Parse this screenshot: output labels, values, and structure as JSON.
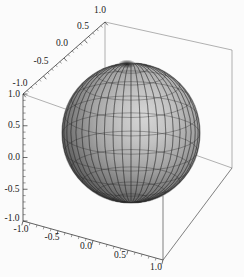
{
  "figure": {
    "type": "3d-surface-plot",
    "title": "",
    "background_color": "#fbfbfb",
    "frame_color": "#4a4a4a",
    "surface_name": "unit-sphere"
  },
  "chart_data": {
    "type": "scatter",
    "plot_style": "3d-parametric-surface",
    "title": "",
    "subtitle": "",
    "xlabel": "",
    "ylabel": "",
    "zlabel": "",
    "grid": false,
    "legend": "none",
    "surface": {
      "name": "Unit sphere",
      "equation": "x^2 + y^2 + z^2 = 1",
      "radius": 1.0,
      "center": [
        0,
        0,
        0
      ],
      "mesh_meridians": 24,
      "mesh_parallels": 12,
      "shading": "gray-diffuse",
      "light_direction": "upper-right",
      "color_min": "#2b2b2b",
      "color_max": "#d8d8d8"
    },
    "axes": [
      {
        "name": "depth-axis",
        "position": "top-left",
        "range": [
          -1.0,
          1.0
        ],
        "ticks": [
          -1.0,
          -0.5,
          0.0,
          0.5,
          1.0
        ],
        "tick_labels": [
          "-1.0",
          "-0.5",
          "0.0",
          "0.5",
          "1.0"
        ],
        "minor_ticks_per_interval": 4
      },
      {
        "name": "vertical-axis",
        "position": "left",
        "range": [
          -1.0,
          1.0
        ],
        "ticks": [
          -1.0,
          -0.5,
          0.0,
          0.5,
          1.0
        ],
        "tick_labels": [
          "-1.0",
          "-0.5",
          "0.0",
          "0.5",
          "1.0"
        ],
        "minor_ticks_per_interval": 4
      },
      {
        "name": "horizontal-axis",
        "position": "bottom",
        "range": [
          -1.0,
          1.0
        ],
        "ticks": [
          -1.0,
          -0.5,
          0.0,
          0.5,
          1.0
        ],
        "tick_labels": [
          "-1.0",
          "-0.5",
          "0.0",
          "0.5",
          "1.0"
        ],
        "minor_ticks_per_interval": 4
      }
    ],
    "x": [
      -1.0,
      -0.5,
      0.0,
      0.5,
      1.0
    ],
    "values": [
      -1.0,
      -0.5,
      0.0,
      0.5,
      1.0
    ],
    "categories": [
      "-1.0",
      "-0.5",
      "0.0",
      "0.5",
      "1.0"
    ],
    "xlim": [
      -1.0,
      1.0
    ],
    "ylim": [
      -1.0,
      1.0
    ],
    "zlim": [
      -1.0,
      1.0
    ]
  },
  "labels": {
    "depth_axis": {
      "t_neg1": "-1.0",
      "t_neg05": "-0.5",
      "t_0": "0.0",
      "t_05": "0.5",
      "t_1": "1.0"
    },
    "vertical_axis": {
      "t_1": "1.0",
      "t_05": "0.5",
      "t_0": "0.0",
      "t_neg05": "-0.5",
      "t_neg1": "-1.0"
    },
    "horizontal_axis": {
      "t_neg1": "-1.0",
      "t_neg05": "-0.5",
      "t_0": "0.0",
      "t_05": "0.5",
      "t_1": "1.0"
    }
  }
}
